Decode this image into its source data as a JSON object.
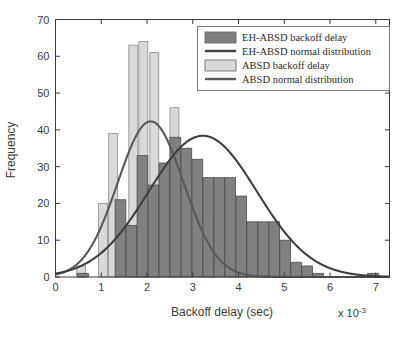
{
  "chart_data": {
    "type": "bar",
    "title": "",
    "xlabel": "Backoff delay (sec)",
    "ylabel": "Frequency",
    "x_multiplier": "x 10",
    "x_multiplier_exp": "-3",
    "xlim": [
      0,
      7.3
    ],
    "ylim": [
      0,
      70
    ],
    "xticks": [
      "0",
      "1",
      "2",
      "3",
      "4",
      "5",
      "6",
      "7"
    ],
    "xtick_values": [
      0,
      1,
      2,
      3,
      4,
      5,
      6,
      7
    ],
    "yticks": [
      "0",
      "10",
      "20",
      "30",
      "40",
      "50",
      "60",
      "70"
    ],
    "ytick_values": [
      0,
      10,
      20,
      30,
      40,
      50,
      60,
      70
    ],
    "grid": false,
    "legend_position": "top-right",
    "series": [
      {
        "name": "EH-ABSD backoff delay",
        "kind": "bar",
        "color": "#808080",
        "edge_color": "#4d4d4d",
        "bar_width": 0.235,
        "x": [
          0.6,
          1.42,
          1.66,
          1.9,
          2.14,
          2.38,
          2.62,
          2.86,
          3.1,
          3.34,
          3.58,
          3.82,
          4.06,
          4.3,
          4.54,
          4.78,
          5.02,
          5.26,
          5.5,
          5.74,
          6.94
        ],
        "values": [
          1,
          21,
          14,
          33,
          25,
          31,
          38,
          35,
          32,
          27,
          27,
          27,
          22,
          15,
          15,
          15,
          10,
          4,
          3,
          1,
          1
        ]
      },
      {
        "name": "EH-ABSD normal distribution",
        "kind": "line",
        "color": "#404040",
        "peak_x": 3.22,
        "peak_y": 38.4,
        "sigma": 1.18,
        "note": "normal curve fitted to EH-ABSD histogram"
      },
      {
        "name": "ABSD backoff delay",
        "kind": "bar",
        "color": "#d9d9d9",
        "edge_color": "#8c8c8c",
        "bar_width": 0.195,
        "x": [
          0.56,
          1.04,
          1.26,
          1.7,
          1.92,
          2.16,
          2.6,
          3.38,
          3.9,
          4.12
        ],
        "values": [
          3,
          20,
          39,
          63,
          64,
          61,
          46,
          17,
          6,
          3
        ]
      },
      {
        "name": "ABSD normal distribution",
        "kind": "line",
        "color": "#595959",
        "peak_x": 2.08,
        "peak_y": 42.3,
        "sigma": 0.72,
        "note": "normal curve fitted to ABSD histogram"
      }
    ],
    "legend_entries": [
      {
        "label": "EH-ABSD backoff delay",
        "marker": "swatch",
        "color": "#808080"
      },
      {
        "label": "EH-ABSD normal distribution",
        "marker": "line",
        "color": "#404040"
      },
      {
        "label": "ABSD backoff delay",
        "marker": "swatch",
        "color": "#d9d9d9"
      },
      {
        "label": "ABSD normal distribution",
        "marker": "line",
        "color": "#595959"
      }
    ]
  },
  "colors": {
    "axis": "#3b3b3b",
    "background": "#ffffff",
    "bar_dark": "#808080",
    "bar_dark_edge": "#4d4d4d",
    "bar_light": "#d9d9d9",
    "bar_light_edge": "#8c8c8c",
    "curve_dark": "#404040",
    "curve_light": "#595959",
    "legend_border": "#7a7a7a"
  }
}
